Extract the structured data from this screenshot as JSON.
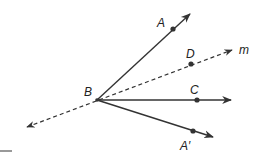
{
  "diagram": {
    "type": "geometry-angle-bisector-reflection",
    "colors": {
      "stroke": "#333333",
      "background": "#ffffff"
    },
    "vertex": {
      "label": "B",
      "x": 97,
      "y": 100,
      "label_x": 84,
      "label_y": 96
    },
    "rays": [
      {
        "name": "ray-BA",
        "label": "A",
        "style": "solid",
        "end_x": 190,
        "end_y": 14,
        "point_x": 173,
        "point_y": 29,
        "label_x": 157,
        "label_y": 27
      },
      {
        "name": "ray-BC",
        "label": "C",
        "style": "solid",
        "end_x": 231,
        "end_y": 100,
        "point_x": 197,
        "point_y": 100,
        "label_x": 190,
        "label_y": 94
      },
      {
        "name": "ray-BA-prime",
        "label": "A′",
        "style": "solid",
        "end_x": 213,
        "end_y": 137,
        "point_x": 193,
        "point_y": 131,
        "label_x": 180,
        "label_y": 150
      }
    ],
    "line_m": {
      "label": "m",
      "style": "dashed",
      "start_x": 27,
      "start_y": 127,
      "end_x": 232,
      "end_y": 50,
      "label_x": 239,
      "label_y": 54,
      "point": {
        "label": "D",
        "x": 191,
        "y": 64,
        "label_x": 186,
        "label_y": 58
      }
    },
    "corner_mark": {
      "x1": 0,
      "y1": 151,
      "x2": 12,
      "y2": 151
    }
  }
}
